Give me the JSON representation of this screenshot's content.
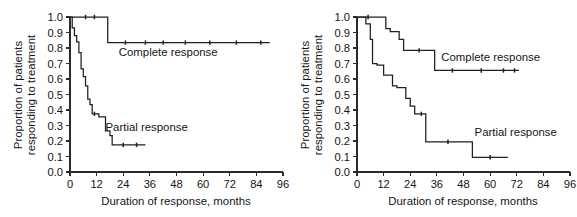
{
  "figure": {
    "panels": [
      {
        "name": "left-panel",
        "ylabel_line1": "Proportion of patients",
        "ylabel_line2": "responding to treatment",
        "xlabel": "Duration of response, months",
        "labels": {
          "complete": "Complete response",
          "partial": "Partial response"
        }
      },
      {
        "name": "right-panel",
        "ylabel_line1": "Proportion of patients",
        "ylabel_line2": "responding to treatment",
        "xlabel": "Duration of response, months",
        "labels": {
          "complete": "Complete response",
          "partial": "Partial response"
        }
      }
    ]
  },
  "chart_data": [
    {
      "type": "line",
      "name": "left-panel",
      "title": "",
      "xlabel": "Duration of response, months",
      "ylabel": "Proportion of patients responding to treatment",
      "xlim": [
        0,
        96
      ],
      "ylim": [
        0.0,
        1.0
      ],
      "xticks": [
        0,
        12,
        24,
        36,
        48,
        60,
        72,
        84,
        96
      ],
      "xtick_labels": [
        "0",
        "12",
        "24",
        "36",
        "48",
        "60",
        "72",
        "84",
        "96"
      ],
      "yticks": [
        0.0,
        0.1,
        0.2,
        0.3,
        0.4,
        0.5,
        0.6,
        0.7,
        0.8,
        0.9,
        1.0
      ],
      "ytick_labels": [
        "0.0",
        "0.1",
        "0.2",
        "0.3",
        "0.4",
        "0.5",
        "0.6",
        "0.7",
        "0.8",
        "0.9",
        "1.0"
      ],
      "grid": false,
      "legend": "inline-annotation",
      "step_interpolation": "post",
      "series": [
        {
          "name": "Complete response",
          "label_x": 22,
          "label_y": 0.75,
          "x": [
            0,
            17,
            17,
            90
          ],
          "y": [
            1.0,
            1.0,
            0.835,
            0.835
          ],
          "censor_x": [
            7,
            11,
            25,
            34,
            42,
            52,
            63,
            75,
            86
          ],
          "censor_y": [
            1.0,
            1.0,
            0.835,
            0.835,
            0.835,
            0.835,
            0.835,
            0.835,
            0.835
          ]
        },
        {
          "name": "Partial response",
          "label_x": 16,
          "label_y": 0.265,
          "x": [
            0,
            1,
            1,
            2,
            2,
            3,
            3,
            4,
            4,
            5,
            5,
            6,
            6,
            7,
            7,
            8,
            8,
            9,
            9,
            10,
            10,
            13,
            13,
            16,
            16,
            18,
            18,
            19,
            19,
            34
          ],
          "y": [
            1.0,
            1.0,
            0.93,
            0.93,
            0.88,
            0.88,
            0.84,
            0.84,
            0.77,
            0.77,
            0.665,
            0.665,
            0.615,
            0.615,
            0.555,
            0.555,
            0.47,
            0.47,
            0.435,
            0.435,
            0.375,
            0.375,
            0.355,
            0.355,
            0.265,
            0.265,
            0.235,
            0.235,
            0.175,
            0.175
          ],
          "censor_x": [
            11,
            24,
            30
          ],
          "censor_y": [
            0.375,
            0.175,
            0.175
          ]
        }
      ]
    },
    {
      "type": "line",
      "name": "right-panel",
      "title": "",
      "xlabel": "Duration of response, months",
      "ylabel": "Proportion of patients responding to treatment",
      "xlim": [
        0,
        96
      ],
      "ylim": [
        0.0,
        1.0
      ],
      "xticks": [
        0,
        12,
        24,
        36,
        48,
        60,
        72,
        84,
        96
      ],
      "xtick_labels": [
        "0",
        "12",
        "24",
        "36",
        "48",
        "60",
        "72",
        "84",
        "96"
      ],
      "yticks": [
        0.0,
        0.1,
        0.2,
        0.3,
        0.4,
        0.5,
        0.6,
        0.7,
        0.8,
        0.9,
        1.0
      ],
      "ytick_labels": [
        "0.0",
        "0.1",
        "0.2",
        "0.3",
        "0.4",
        "0.5",
        "0.6",
        "0.7",
        "0.8",
        "0.9",
        "1.0"
      ],
      "grid": false,
      "legend": "inline-annotation",
      "step_interpolation": "post",
      "series": [
        {
          "name": "Complete response",
          "label_x": 38,
          "label_y": 0.715,
          "x": [
            0,
            13,
            13,
            15,
            15,
            19,
            19,
            21,
            21,
            35,
            35,
            73
          ],
          "y": [
            1.0,
            1.0,
            0.925,
            0.925,
            0.905,
            0.905,
            0.855,
            0.855,
            0.785,
            0.785,
            0.655,
            0.655
          ],
          "censor_x": [
            5,
            28,
            43,
            56,
            66,
            71
          ],
          "censor_y": [
            1.0,
            0.785,
            0.655,
            0.655,
            0.655,
            0.655
          ]
        },
        {
          "name": "Partial response",
          "label_x": 53,
          "label_y": 0.235,
          "x": [
            0,
            4,
            4,
            6,
            6,
            7,
            7,
            9,
            9,
            12,
            12,
            16,
            16,
            18,
            18,
            22,
            22,
            24,
            24,
            26,
            26,
            28,
            28,
            31,
            31,
            52,
            52,
            68
          ],
          "y": [
            1.0,
            1.0,
            0.955,
            0.955,
            0.855,
            0.855,
            0.7,
            0.7,
            0.69,
            0.69,
            0.625,
            0.625,
            0.555,
            0.555,
            0.545,
            0.545,
            0.475,
            0.475,
            0.425,
            0.425,
            0.375,
            0.375,
            0.375,
            0.375,
            0.195,
            0.195,
            0.095,
            0.095
          ],
          "censor_x": [
            29,
            41,
            60
          ],
          "censor_y": [
            0.375,
            0.195,
            0.095
          ]
        }
      ]
    }
  ]
}
